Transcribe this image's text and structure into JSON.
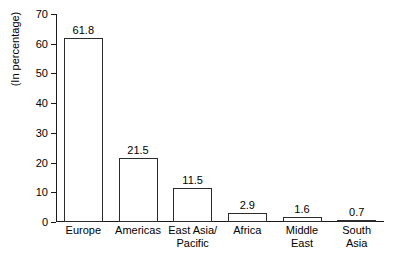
{
  "chart_data": {
    "type": "bar",
    "title": "",
    "subtitle": "",
    "xlabel": "",
    "ylabel": "(In percentage)",
    "categories": [
      "Europe",
      "Americas",
      "East Asia/\nPacific",
      "Africa",
      "Middle\nEast",
      "South\nAsia"
    ],
    "values": [
      61.8,
      21.5,
      11.5,
      2.9,
      1.6,
      0.7
    ],
    "value_labels": [
      "61.8",
      "21.5",
      "11.5",
      "2.9",
      "1.6",
      "0.7"
    ],
    "ylim": [
      0,
      70
    ],
    "ytick_labels": [
      "0",
      "10",
      "20",
      "30",
      "40",
      "50",
      "60",
      "70"
    ],
    "ytick_values": [
      0,
      10,
      20,
      30,
      40,
      50,
      60,
      70
    ],
    "grid": false,
    "legend": null,
    "bar_fill_color": "#ffffff",
    "bar_edge_color": "#2b2b2b",
    "axis_color": "#1a1a1a",
    "background_color": "#ffffff"
  }
}
